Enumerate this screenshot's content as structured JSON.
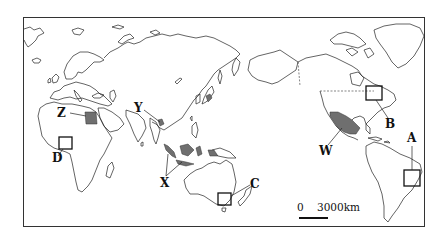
{
  "map": {
    "projection": "Pacific-centered world map",
    "labels": {
      "A": "A",
      "B": "B",
      "C": "C",
      "D": "D",
      "W": "W",
      "X": "X",
      "Y": "Y",
      "Z": "Z"
    },
    "boxed_regions": [
      "A",
      "B",
      "C",
      "D"
    ],
    "shaded_regions": [
      "W",
      "X",
      "Y",
      "Z"
    ],
    "scale": {
      "start": "0",
      "end": "3000km"
    },
    "colors": {
      "outline": "#222222",
      "shaded": "#6f6f6f",
      "background": "#ffffff"
    }
  }
}
